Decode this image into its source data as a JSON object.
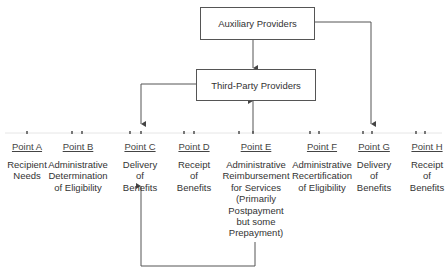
{
  "boxes": {
    "auxiliary": "Auxiliary Providers",
    "third_party": "Third-Party Providers"
  },
  "points": [
    {
      "label": "Point A",
      "lines": [
        "Recipient",
        "Needs"
      ]
    },
    {
      "label": "Point B",
      "lines": [
        "Administrative",
        "Determination",
        "of Eligibility"
      ]
    },
    {
      "label": "Point C",
      "lines": [
        "Delivery",
        "of",
        "Benefits"
      ]
    },
    {
      "label": "Point D",
      "lines": [
        "Receipt",
        "of",
        "Benefits"
      ]
    },
    {
      "label": "Point E",
      "lines": [
        "Administrative",
        "Reimbursement",
        "for Services",
        "(Primarily",
        "Postpayment",
        "but some",
        "Prepayment)"
      ]
    },
    {
      "label": "Point F",
      "lines": [
        "Administrative",
        "Recertification",
        "of Eligibility"
      ]
    },
    {
      "label": "Point G",
      "lines": [
        "Delivery",
        "of",
        "Benefits"
      ]
    },
    {
      "label": "Point H",
      "lines": [
        "Receipt",
        "of",
        "Benefits"
      ]
    }
  ],
  "colors": {
    "line": "#555555",
    "text": "#333333",
    "timeline": "#dddddd"
  }
}
